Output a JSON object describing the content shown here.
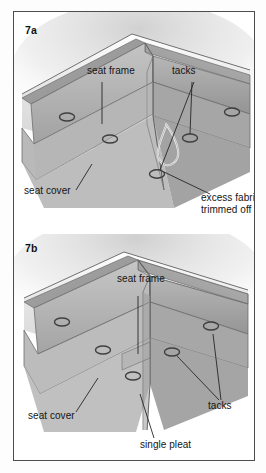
{
  "figure": {
    "border_color": "#4d4d4d",
    "background": "#ffffff"
  },
  "panels": [
    {
      "id": "7a",
      "tag": "7a",
      "caption": "Corner with excess fabric trimmed off",
      "labels": [
        {
          "name": "seat-frame",
          "text": "seat frame"
        },
        {
          "name": "tacks",
          "text": "tacks"
        },
        {
          "name": "seat-cover",
          "text": "seat cover"
        },
        {
          "name": "excess-fabric",
          "text": "excess fabric",
          "text2": "trimmed off"
        }
      ],
      "tack_count": 5
    },
    {
      "id": "7b",
      "tag": "7b",
      "caption": "Corner finished with a single pleat",
      "labels": [
        {
          "name": "seat-frame",
          "text": "seat frame"
        },
        {
          "name": "tacks",
          "text": "tacks"
        },
        {
          "name": "seat-cover",
          "text": "seat cover"
        },
        {
          "name": "single-pleat",
          "text": "single pleat"
        }
      ],
      "tack_count": 5
    }
  ],
  "colors": {
    "ink": "#141414",
    "leader": "#2b2b2b",
    "frame_top": "#9a9a9a",
    "frame_face": "#8d8d8d",
    "cover_light": "#c9c9c9",
    "cover_mid": "#b0b0b0",
    "cover_dark": "#9b9b9b",
    "tack": "#555555",
    "pad": "#dcdcdc"
  }
}
